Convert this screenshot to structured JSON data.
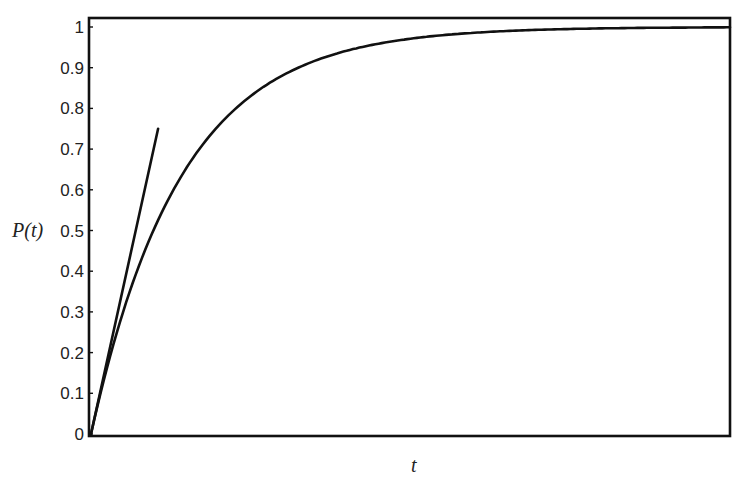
{
  "chart_data": {
    "type": "line",
    "title": "",
    "xlabel": "t",
    "ylabel": "P(t)",
    "xlim": [
      0,
      1
    ],
    "ylim": [
      0,
      1
    ],
    "grid": false,
    "legend": null,
    "yticks": [
      "0",
      "0.1",
      "0.2",
      "0.3",
      "0.4",
      "0.5",
      "0.6",
      "0.7",
      "0.8",
      "0.9",
      "1"
    ],
    "xticks": [],
    "series": [
      {
        "name": "P(t) = 1 - e^(-k t)",
        "k": 7.1,
        "x": [
          0,
          0.05,
          0.1,
          0.15,
          0.2,
          0.25,
          0.3,
          0.4,
          0.5,
          0.6,
          0.7,
          0.8,
          0.9,
          1.0
        ],
        "values": [
          0,
          0.3,
          0.51,
          0.66,
          0.76,
          0.83,
          0.88,
          0.94,
          0.97,
          0.99,
          0.99,
          1.0,
          1.0,
          1.0
        ]
      },
      {
        "name": "tangent at t=0",
        "x": [
          0,
          0.105
        ],
        "values": [
          0,
          0.75
        ]
      }
    ]
  }
}
